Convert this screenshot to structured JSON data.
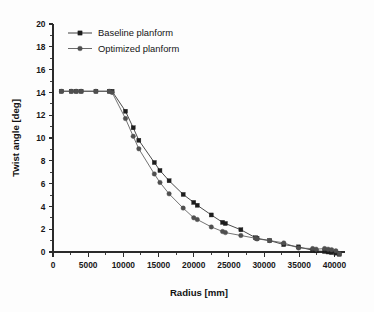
{
  "chart_data": {
    "type": "line",
    "title": "",
    "subtitle": "",
    "xlabel": "Radius [mm]",
    "ylabel": "Twist angle [deg]",
    "xlim": [
      0,
      41500
    ],
    "ylim": [
      -1.2,
      20
    ],
    "xticks": [
      0,
      5000,
      10000,
      15000,
      20000,
      25000,
      30000,
      35000,
      40000
    ],
    "xticklabels": [
      "0",
      "5000",
      "10000",
      "15000",
      "20000",
      "25000",
      "30000",
      "35000",
      "40000"
    ],
    "yticks": [
      0,
      2,
      4,
      6,
      8,
      10,
      12,
      14,
      16,
      18,
      20
    ],
    "yticklabels": [
      "0",
      "2",
      "4",
      "6",
      "8",
      "10",
      "12",
      "14",
      "16",
      "18",
      "20"
    ],
    "grid": false,
    "legend_position": "top-left",
    "frame": "left-bottom",
    "series": [
      {
        "name": "Baseline planform",
        "marker": "square",
        "color": "#1d1d1d",
        "x": [
          1200,
          2600,
          3300,
          4000,
          6100,
          8000,
          8400,
          10300,
          11400,
          12200,
          14400,
          15200,
          16500,
          18500,
          20000,
          20500,
          22500,
          24100,
          24500,
          26700,
          28800,
          29000,
          30800,
          32800,
          34900,
          36900,
          37400,
          38600,
          39100,
          39600,
          40200,
          40700
        ],
        "y": [
          14.1,
          14.1,
          14.1,
          14.1,
          14.1,
          14.1,
          14.1,
          12.35,
          10.9,
          9.8,
          7.85,
          7.15,
          6.25,
          5.05,
          4.35,
          4.1,
          3.25,
          2.6,
          2.5,
          1.95,
          1.25,
          1.2,
          1.0,
          0.65,
          0.45,
          0.15,
          0.1,
          0.05,
          0.0,
          -0.05,
          -0.1,
          -0.2
        ]
      },
      {
        "name": "Optimized planform",
        "marker": "circle",
        "color": "#4f4f4f",
        "x": [
          1200,
          2600,
          3300,
          4000,
          6100,
          8000,
          8400,
          10300,
          11400,
          12200,
          14400,
          15200,
          16500,
          18500,
          20000,
          20500,
          22500,
          24100,
          24500,
          26700,
          28800,
          29000,
          30800,
          32800,
          34900,
          36900,
          37400,
          38600,
          39100,
          39600,
          40200,
          40700
        ],
        "y": [
          14.1,
          14.1,
          14.1,
          14.1,
          14.1,
          14.1,
          14.0,
          11.7,
          10.15,
          9.05,
          6.85,
          6.1,
          5.1,
          3.85,
          3.0,
          2.85,
          2.2,
          1.8,
          1.7,
          1.45,
          1.2,
          1.15,
          1.0,
          0.8,
          0.35,
          0.3,
          0.25,
          0.3,
          0.25,
          0.2,
          0.1,
          -0.15
        ]
      }
    ],
    "legend": [
      {
        "label": "Baseline planform",
        "marker": "square",
        "color": "#1d1d1d"
      },
      {
        "label": "Optimized planform",
        "marker": "circle",
        "color": "#4f4f4f"
      }
    ]
  }
}
